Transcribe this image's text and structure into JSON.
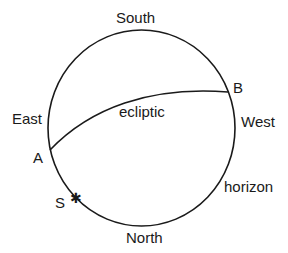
{
  "diagram": {
    "labels": {
      "south": "South",
      "north": "North",
      "east": "East",
      "west": "West",
      "ecliptic": "ecliptic",
      "horizon": "horizon",
      "point_a": "A",
      "point_b": "B",
      "star_s": "S"
    },
    "star_glyph": "✱",
    "colors": {
      "line": "#1a1a1a",
      "background": "#ffffff"
    }
  }
}
